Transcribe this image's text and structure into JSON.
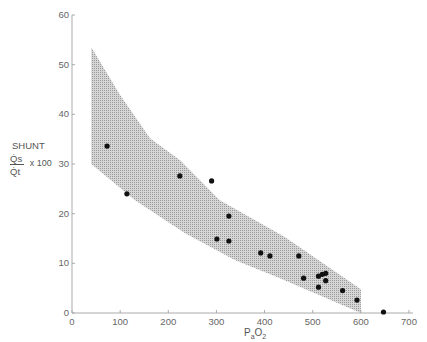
{
  "chart_data": {
    "type": "scatter",
    "title": "",
    "xlabel": "PaO2",
    "ylabel": "SHUNT Qs/Qt x 100",
    "xlim": [
      0,
      700
    ],
    "ylim": [
      0,
      60
    ],
    "x_ticks": [
      0,
      100,
      200,
      300,
      400,
      500,
      600,
      700
    ],
    "y_ticks": [
      0,
      10,
      20,
      30,
      40,
      50,
      60
    ],
    "grid": false,
    "legend": null,
    "series": [
      {
        "name": "observations",
        "points": [
          {
            "x": 73,
            "y": 33.6
          },
          {
            "x": 114,
            "y": 24.0
          },
          {
            "x": 224,
            "y": 27.6
          },
          {
            "x": 290,
            "y": 26.6
          },
          {
            "x": 326,
            "y": 19.5
          },
          {
            "x": 301,
            "y": 14.9
          },
          {
            "x": 326,
            "y": 14.5
          },
          {
            "x": 392,
            "y": 12.1
          },
          {
            "x": 411,
            "y": 11.5
          },
          {
            "x": 471,
            "y": 11.5
          },
          {
            "x": 481,
            "y": 7.0
          },
          {
            "x": 512,
            "y": 7.4
          },
          {
            "x": 520,
            "y": 7.8
          },
          {
            "x": 527,
            "y": 8.0
          },
          {
            "x": 527,
            "y": 6.5
          },
          {
            "x": 512,
            "y": 5.2
          },
          {
            "x": 562,
            "y": 4.5
          },
          {
            "x": 592,
            "y": 2.6
          },
          {
            "x": 647,
            "y": 0.2
          }
        ]
      }
    ],
    "band": {
      "name": "shaded range",
      "upper": [
        {
          "x": 40,
          "y": 53.5
        },
        {
          "x": 100,
          "y": 43.9
        },
        {
          "x": 162,
          "y": 35.2
        },
        {
          "x": 224,
          "y": 30.8
        },
        {
          "x": 307,
          "y": 22.7
        },
        {
          "x": 442,
          "y": 15.3
        },
        {
          "x": 600,
          "y": 4.8
        }
      ],
      "lower": [
        {
          "x": 40,
          "y": 30.0
        },
        {
          "x": 131,
          "y": 22.7
        },
        {
          "x": 234,
          "y": 16.1
        },
        {
          "x": 338,
          "y": 10.7
        },
        {
          "x": 427,
          "y": 7.2
        },
        {
          "x": 600,
          "y": 0.0
        }
      ]
    }
  },
  "labels": {
    "y_shunt": "SHUNT",
    "y_num": "Q̇s",
    "y_den": "Q̇t",
    "y_mult": "x 100",
    "x_main": "P",
    "x_sub1": "a",
    "x_mid": "O",
    "x_sub2": "2"
  },
  "colors": {
    "band": "#c8c8c8",
    "point": "#111111",
    "axis": "#aaaaaa"
  }
}
